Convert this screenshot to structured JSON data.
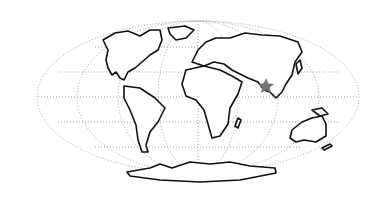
{
  "map": {
    "projection": "mollweide",
    "style": "outline world map with dotted graticule",
    "marker": {
      "type": "star",
      "region": "South Asia (Bangladesh / eastern India)",
      "color": "#777777"
    },
    "colors": {
      "land_outline": "#111111",
      "land_fill": "#ffffff",
      "graticule": "#9a9a9a",
      "background": "#ffffff"
    }
  }
}
